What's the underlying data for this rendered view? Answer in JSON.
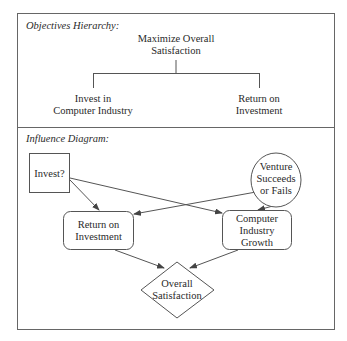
{
  "objectives_hierarchy": {
    "section_title": "Objectives Hierarchy:",
    "root": {
      "line1": "Maximize Overall",
      "line2": "Satisfaction"
    },
    "children": [
      {
        "line1": "Invest in",
        "line2": "Computer Industry"
      },
      {
        "line1": "Return on",
        "line2": "Investment"
      }
    ]
  },
  "influence_diagram": {
    "section_title": "Influence Diagram:",
    "nodes": {
      "decision": {
        "type": "decision",
        "line1": "Invest?"
      },
      "chance": {
        "type": "chance",
        "line1": "Venture",
        "line2": "Succeeds",
        "line3": "or Fails"
      },
      "roi": {
        "type": "intermediate",
        "line1": "Return on",
        "line2": "Investment"
      },
      "growth": {
        "type": "intermediate",
        "line1": "Computer",
        "line2": "Industry",
        "line3": "Growth"
      },
      "value": {
        "type": "value",
        "line1": "Overall",
        "line2": "Satisfaction"
      }
    },
    "arcs": [
      {
        "from": "Invest?",
        "to": "Return on Investment"
      },
      {
        "from": "Invest?",
        "to": "Computer Industry Growth"
      },
      {
        "from": "Venture Succeeds or Fails",
        "to": "Return on Investment"
      },
      {
        "from": "Venture Succeeds or Fails",
        "to": "Computer Industry Growth"
      },
      {
        "from": "Return on Investment",
        "to": "Overall Satisfaction"
      },
      {
        "from": "Computer Industry Growth",
        "to": "Overall Satisfaction"
      }
    ]
  },
  "colors": {
    "line": "#555555",
    "text": "#2a2a2a",
    "background": "#ffffff"
  }
}
